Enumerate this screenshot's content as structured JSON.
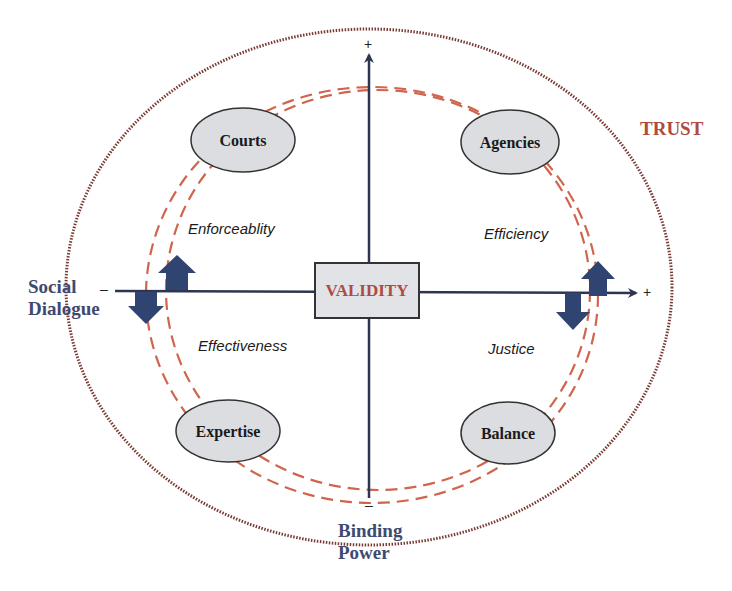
{
  "center": {
    "label": "VALIDITY"
  },
  "outer_ring": {
    "label": "TRUST",
    "style": "dotted",
    "color": "#8a3a30"
  },
  "inner_rings": {
    "count": 2,
    "style": "dashed",
    "color": "#d0654d"
  },
  "axes": {
    "horizontal": {
      "label_line1": "Social",
      "label_line2": "Dialogue",
      "neg_sign": "–",
      "pos_sign": "+"
    },
    "vertical": {
      "label_line1": "Binding",
      "label_line2": "Power",
      "neg_sign": "–",
      "pos_sign": "+"
    }
  },
  "quadrants": [
    {
      "position": "top-left",
      "node": "Courts",
      "value": "Enforceablity"
    },
    {
      "position": "top-right",
      "node": "Agencies",
      "value": "Efficiency"
    },
    {
      "position": "bottom-left",
      "node": "Expertise",
      "value": "Effectiveness"
    },
    {
      "position": "bottom-right",
      "node": "Balance",
      "value": "Justice"
    }
  ],
  "arrows": [
    {
      "location": "left",
      "direction": "up"
    },
    {
      "location": "left",
      "direction": "down"
    },
    {
      "location": "right",
      "direction": "up"
    },
    {
      "location": "right",
      "direction": "down"
    }
  ],
  "colors": {
    "axis": "#2e3550",
    "arrow_fill": "#2f4470",
    "node_fill": "#dcdde0",
    "validity_box_fill": "#e2e3e6",
    "axis_label": "#3f4a72",
    "accent_red": "#b04a3e"
  }
}
